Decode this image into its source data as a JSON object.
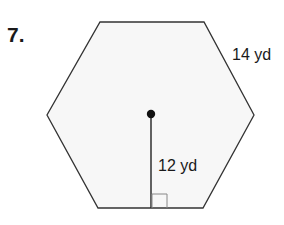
{
  "problem": {
    "number_label": "7."
  },
  "figure": {
    "shape": "regular hexagon",
    "fill_color": "#f7f7f7",
    "stroke_color": "#333333",
    "side_label": "14 yd",
    "apothem_label": "12 yd",
    "vertices": [
      [
        100,
        22
      ],
      [
        204,
        22
      ],
      [
        254,
        115
      ],
      [
        203,
        208
      ],
      [
        98,
        208
      ],
      [
        47,
        115
      ]
    ],
    "center": [
      151,
      114
    ],
    "apothem_foot": [
      151,
      208
    ],
    "right_angle_marker": {
      "x": 152,
      "y": 194,
      "size": 14
    }
  }
}
